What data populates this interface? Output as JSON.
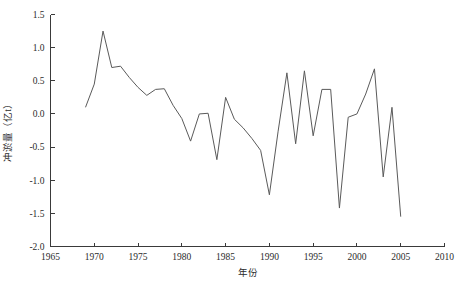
{
  "chart_data": {
    "type": "line",
    "title": "",
    "xlabel": "年份",
    "ylabel": "冲淤量（亿t）",
    "xlim": [
      1965,
      2010
    ],
    "ylim": [
      -2.0,
      1.5
    ],
    "grid": false,
    "legend": null,
    "xticks": [
      1965,
      1970,
      1975,
      1980,
      1985,
      1990,
      1995,
      2000,
      2005,
      2010
    ],
    "yticks": [
      -2.0,
      -1.5,
      -1.0,
      -0.5,
      0.0,
      0.5,
      1.0,
      1.5
    ],
    "xtick_labels": [
      "1965",
      "1970",
      "1975",
      "1980",
      "1985",
      "1990",
      "1995",
      "2000",
      "2005",
      "2010"
    ],
    "ytick_labels": [
      "-2.0",
      "-1.5",
      "-1.0",
      "-0.5",
      "0.0",
      "0.5",
      "1.0",
      "1.5"
    ],
    "series": [
      {
        "name": "冲淤量",
        "x": [
          1969,
          1970,
          1971,
          1972,
          1973,
          1974,
          1975,
          1976,
          1977,
          1978,
          1979,
          1980,
          1981,
          1982,
          1983,
          1984,
          1985,
          1986,
          1987,
          1988,
          1989,
          1990,
          1991,
          1992,
          1993,
          1994,
          1995,
          1996,
          1997,
          1998,
          1999,
          2000,
          2001,
          2002,
          2003,
          2004,
          2005
        ],
        "values": [
          0.1,
          0.45,
          1.25,
          0.7,
          0.72,
          0.55,
          0.4,
          0.28,
          0.37,
          0.38,
          0.13,
          -0.07,
          -0.41,
          0.0,
          0.01,
          -0.69,
          0.25,
          -0.08,
          -0.21,
          -0.37,
          -0.55,
          -1.22,
          -0.26,
          0.62,
          -0.45,
          0.65,
          -0.33,
          0.37,
          0.37,
          -1.42,
          -0.05,
          0.0,
          0.3,
          0.68,
          -0.95,
          0.1,
          -1.55
        ]
      }
    ]
  }
}
